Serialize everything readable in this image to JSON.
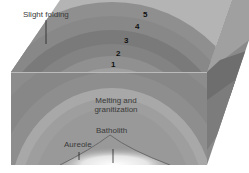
{
  "diagram": {
    "labels": {
      "slight_folding": "Slight folding",
      "melting_line1": "Melting and",
      "melting_line2": "granitization",
      "batholith": "Batholith",
      "aureole": "Aureole"
    },
    "layer_numbers": [
      "1",
      "2",
      "3",
      "4",
      "5"
    ],
    "colors": {
      "background": "#ffffff",
      "top_surface_light": "#b4b4b4",
      "layer_outer": "#8f8f8f",
      "layer_mid_dark": "#7a7a7a",
      "layer_band_light": "#a9a9a9",
      "core": "#9c9c9c",
      "side_face": "#6e6e6e",
      "batholith_glow": "#f2f2f2",
      "text": "#3a3a3a"
    }
  }
}
